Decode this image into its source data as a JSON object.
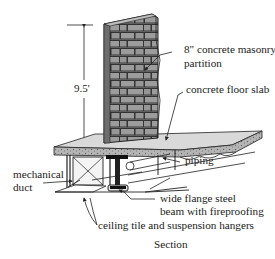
{
  "diagram": {
    "type": "architectural-section",
    "caption": "Section",
    "dimension": {
      "label": "9.5'",
      "meaning": "floor-to-top-of-partition height"
    },
    "labels": {
      "partition_line1": "8\" concrete masonry",
      "partition_line2": "partition",
      "slab": "concrete floor slab",
      "piping": "piping",
      "duct_line1": "mechanical",
      "duct_line2": "duct",
      "beam_line1": "wide flange steel",
      "beam_line2": "beam with fireproofing",
      "ceiling": "ceiling tile and suspension hangers"
    },
    "colors": {
      "brick": "#8c8c8c",
      "mortar": "#3a3a3a",
      "slab_top": "#d9d9d9",
      "slab_edge": "#a8a8a8",
      "line": "#222222",
      "background": "#ffffff"
    }
  }
}
